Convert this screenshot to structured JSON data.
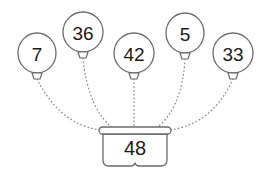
{
  "diagram": {
    "colors": {
      "stroke": "#6b6b6b",
      "string": "#8a8a8a",
      "text": "#1a1a1a",
      "background": "#ffffff"
    },
    "balloons": [
      {
        "label": "7",
        "cx": 37,
        "cy": 53,
        "rx": 19,
        "ry": 20,
        "knot_y": 73,
        "string_end_x": 102,
        "string_ctrl_x": 60,
        "string_ctrl_y": 125
      },
      {
        "label": "36",
        "cx": 83,
        "cy": 32,
        "rx": 20,
        "ry": 20,
        "knot_y": 52,
        "string_end_x": 116,
        "string_ctrl_x": 88,
        "string_ctrl_y": 110
      },
      {
        "label": "42",
        "cx": 134,
        "cy": 53,
        "rx": 20,
        "ry": 20,
        "knot_y": 73,
        "string_end_x": 134,
        "string_ctrl_x": 134,
        "string_ctrl_y": 105
      },
      {
        "label": "5",
        "cx": 185,
        "cy": 33,
        "rx": 19,
        "ry": 20,
        "knot_y": 53,
        "string_end_x": 153,
        "string_ctrl_x": 182,
        "string_ctrl_y": 110
      },
      {
        "label": "33",
        "cx": 233,
        "cy": 53,
        "rx": 20,
        "ry": 20,
        "knot_y": 73,
        "string_end_x": 168,
        "string_ctrl_x": 212,
        "string_ctrl_y": 125
      }
    ],
    "basket": {
      "label": "48",
      "rim_x": 99,
      "rim_y": 127,
      "rim_w": 72,
      "rim_h": 7,
      "body_x": 103,
      "body_y": 134,
      "body_w": 64,
      "body_h": 32,
      "text_x": 135,
      "text_y": 148
    }
  }
}
